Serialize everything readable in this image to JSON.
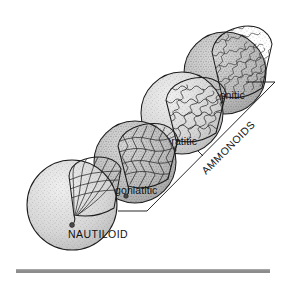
{
  "figure": {
    "background_color": "#ffffff",
    "width": 287,
    "height": 283
  },
  "shells": [
    {
      "id": "nautiloid",
      "label": "NAUTILOID",
      "label_case": "uppercase",
      "suture_type": "simple gently curved",
      "order": 1,
      "label_x": 68,
      "label_y": 238,
      "body_fill": "#d9d9d9",
      "chamber_fill": "#f2f2f2"
    },
    {
      "id": "goniatitic",
      "label": "goniatitic",
      "label_case": "lowercase",
      "suture_type": "angular zigzag",
      "order": 2,
      "label_x": 115,
      "label_y": 194,
      "body_fill": "#bdbdbd",
      "chamber_fill": "#cfcfcf"
    },
    {
      "id": "ceratitic",
      "label": "ceratitic",
      "label_case": "lowercase",
      "suture_type": "crenulated lobes, rounded saddles",
      "order": 3,
      "label_x": 160,
      "label_y": 145,
      "body_fill": "#d4d4d4",
      "chamber_fill": "#fafafa"
    },
    {
      "id": "ammonitic",
      "label": "ammonitic",
      "label_case": "lowercase",
      "suture_type": "highly frilled and subdivided",
      "order": 4,
      "label_x": 196,
      "label_y": 99,
      "body_fill": "#c9c9c9",
      "chamber_fill": "#cccccc"
    }
  ],
  "bracket": {
    "label": "AMMONOIDS",
    "label_rotation_deg": -45,
    "label_x": 206,
    "label_y": 175,
    "stroke_color": "#1c1c1c",
    "covers": [
      "goniatitic",
      "ceratitic",
      "ammonitic"
    ]
  },
  "baseline_bar": {
    "name": "scale-bar",
    "color": "#8c8c8c",
    "x": 16,
    "y": 269,
    "width": 254,
    "height": 4
  },
  "palette": {
    "ink": "#1c1c1c",
    "shell_light": "#f2f2f2",
    "shell_mid": "#d4d4d4",
    "shell_dark": "#bdbdbd",
    "bar_gray": "#8c8c8c",
    "background": "#ffffff"
  }
}
